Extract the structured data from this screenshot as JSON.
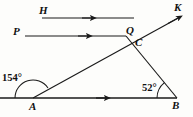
{
  "figure": {
    "type": "geometry-diagram",
    "width": 193,
    "height": 117,
    "background_color": "#fdfdfb",
    "stroke_color": "#1a1a1a",
    "points": {
      "H": {
        "label": "H",
        "x": 42,
        "y": 18
      },
      "K": {
        "label": "K",
        "x": 180,
        "y": 17
      },
      "P": {
        "label": "P",
        "x": 24,
        "y": 36
      },
      "Q": {
        "label": "Q",
        "x": 126,
        "y": 36
      },
      "C": {
        "label": "C",
        "x": 133,
        "y": 45
      },
      "A": {
        "label": "A",
        "x": 33,
        "y": 98
      },
      "B": {
        "label": "B",
        "x": 177,
        "y": 98
      }
    },
    "angles": [
      {
        "name": "angle-at-A",
        "label": "154°",
        "vertex": "A",
        "value": 154,
        "unit": "degrees"
      },
      {
        "name": "angle-at-B",
        "label": "52°",
        "vertex": "B",
        "value": 52,
        "unit": "degrees"
      }
    ],
    "segments": [
      {
        "name": "ray-H",
        "from": "H",
        "to": "right-end",
        "arrow": true,
        "direction": "right"
      },
      {
        "name": "ray-P",
        "from": "P",
        "to": "Q",
        "arrow": true,
        "direction": "right"
      },
      {
        "name": "line-AK",
        "from": "A",
        "to": "K",
        "arrow": true,
        "direction": "up-right"
      },
      {
        "name": "segment-QB",
        "from": "Q",
        "to": "B",
        "arrow": false
      },
      {
        "name": "line-AB",
        "from": "left-end",
        "to": "B",
        "arrow": true,
        "direction": "right"
      }
    ]
  }
}
